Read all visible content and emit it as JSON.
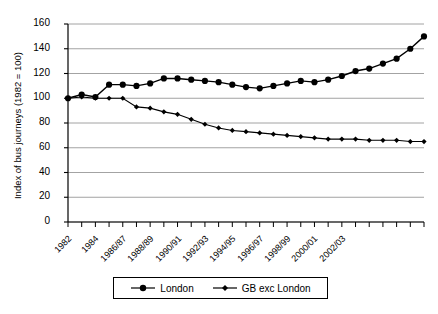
{
  "chart_data": {
    "type": "line",
    "title": "",
    "xlabel": "",
    "ylabel": "Index of bus journeys (1982 = 100)",
    "ylim": [
      0,
      160
    ],
    "yticks": [
      0,
      20,
      40,
      60,
      80,
      100,
      120,
      140,
      160
    ],
    "grid": true,
    "legend_position": "bottom",
    "x": [
      "1982",
      "1983",
      "1984",
      "1985/86",
      "1986/87",
      "1987/88",
      "1988/89",
      "1989/90",
      "1990/91",
      "1991/92",
      "1992/93",
      "1993/94",
      "1994/95",
      "1995/96",
      "1996/97",
      "1997/98",
      "1998/99",
      "1999/00",
      "2000/01",
      "2001/02",
      "2002/03",
      "2003/04"
    ],
    "xtick_labels": [
      "1982",
      "1984",
      "1986/87",
      "1988/89",
      "1990/91",
      "1992/93",
      "1994/95",
      "1996/97",
      "1998/99",
      "2000/01",
      "2002/03"
    ],
    "xtick_indices": [
      0,
      2,
      4,
      6,
      8,
      10,
      12,
      14,
      16,
      18,
      20
    ],
    "series": [
      {
        "name": "London",
        "marker": "circle",
        "color": "#000000",
        "values": [
          100,
          103,
          101,
          111,
          111,
          110,
          112,
          116,
          116,
          116,
          115,
          114,
          113,
          111,
          110,
          109,
          112,
          114,
          116,
          119,
          122,
          124
        ]
      },
      {
        "name": "GB exc London",
        "marker": "diamond",
        "color": "#000000",
        "values": [
          100,
          101,
          100,
          100,
          100,
          93,
          92,
          89,
          87,
          83,
          79,
          76,
          74,
          73,
          72,
          70,
          69,
          67,
          66,
          66,
          65,
          65
        ]
      }
    ],
    "series_london_full": [
      100,
      103,
      101,
      111,
      111,
      110,
      112,
      116,
      116,
      116,
      115,
      114,
      113,
      111,
      110,
      109,
      112,
      114,
      116,
      119,
      122,
      124,
      127,
      131,
      136,
      143,
      150
    ],
    "london_values": [
      100,
      103,
      101,
      111,
      111,
      110,
      112,
      116,
      116,
      115,
      114,
      113,
      111,
      109,
      108,
      110,
      112,
      114,
      113,
      115,
      118,
      122,
      124,
      128,
      132,
      140,
      150
    ],
    "gb_values": [
      100,
      101,
      100,
      100,
      100,
      93,
      92,
      89,
      87,
      83,
      79,
      76,
      74,
      73,
      72,
      71,
      70,
      69,
      68,
      67,
      67,
      67,
      66,
      66,
      66,
      65,
      65
    ]
  },
  "legend": {
    "items": [
      {
        "label": "London",
        "marker": "circle"
      },
      {
        "label": "GB exc London",
        "marker": "diamond"
      }
    ]
  },
  "axis": {
    "y_label": "Index of bus journeys (1982 = 100)"
  }
}
